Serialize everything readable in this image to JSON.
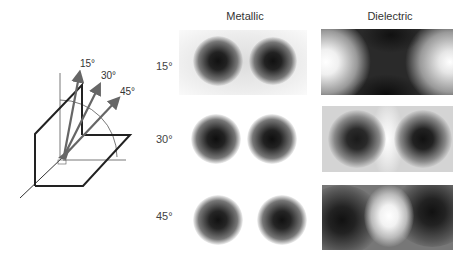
{
  "figure": {
    "columns": [
      {
        "label": "Metallic"
      },
      {
        "label": "Dielectric"
      }
    ],
    "rows": [
      {
        "angle": "15°"
      },
      {
        "angle": "30°"
      },
      {
        "angle": "45°"
      }
    ],
    "diagram": {
      "arrow_labels": [
        "15°",
        "30°",
        "45°"
      ],
      "arrow_color": "#666666",
      "plane_color": "#222222"
    }
  }
}
